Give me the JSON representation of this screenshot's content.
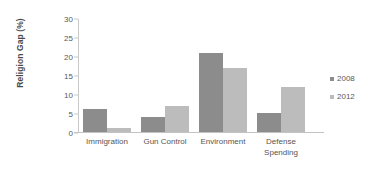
{
  "chart_data": {
    "type": "bar",
    "title": "",
    "xlabel": "",
    "ylabel": "Religion Gap (%)",
    "categories": [
      "Immigration",
      "Gun Control",
      "Environment",
      "Defense Spending"
    ],
    "category_lines": [
      [
        "Immigration"
      ],
      [
        "Gun Control"
      ],
      [
        "Environment"
      ],
      [
        "Defense",
        "Spending"
      ]
    ],
    "series": [
      {
        "name": "2008",
        "values": [
          6,
          4,
          21,
          5
        ],
        "color": "#8c8c8c"
      },
      {
        "name": "2012",
        "values": [
          1,
          7,
          17,
          12
        ],
        "color": "#bcbcbc"
      }
    ],
    "ylim": [
      0,
      30
    ],
    "yticks": [
      0,
      5,
      10,
      15,
      20,
      25,
      30
    ],
    "ytick_labels": [
      "0",
      "5",
      "10",
      "15",
      "20",
      "25",
      "30"
    ],
    "grid": false,
    "legend_position": "right"
  }
}
